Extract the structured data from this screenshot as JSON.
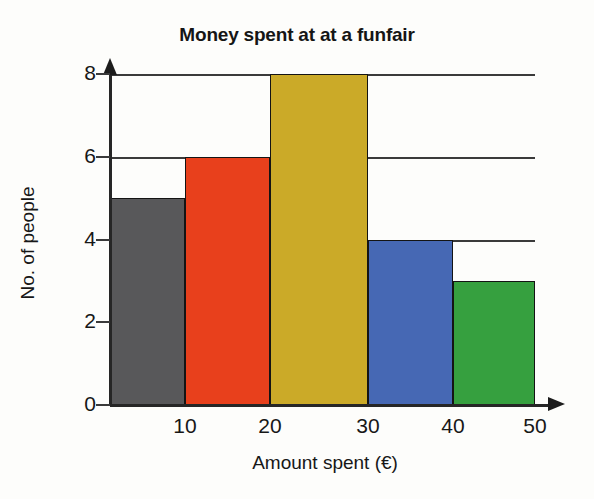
{
  "chart_data": {
    "type": "bar",
    "title": "Money spent at at a funfair",
    "xlabel": "Amount spent (€)",
    "ylabel": "No. of people",
    "categories": [
      "0-10",
      "10-20",
      "20-30",
      "30-40",
      "40-50"
    ],
    "values": [
      5,
      6,
      8,
      4,
      3
    ],
    "bin_edges": [
      0,
      10,
      20,
      30,
      40,
      50
    ],
    "bar_colors": [
      "#58585a",
      "#e8401c",
      "#cbaa28",
      "#4668b4",
      "#36a03f"
    ],
    "xtick_labels": [
      "10",
      "20",
      "30",
      "40",
      "50"
    ],
    "xticks": [
      10,
      20,
      30,
      40,
      50
    ],
    "ytick_labels": [
      "0",
      "2",
      "4",
      "6",
      "8"
    ],
    "yticks": [
      0,
      2,
      4,
      6,
      8
    ],
    "ylim": [
      0,
      8
    ],
    "xlim": [
      0,
      50
    ],
    "grid": true,
    "gridlines_at": [
      4,
      6,
      8
    ],
    "legend": null,
    "axis_color": "#262626",
    "grid_color": "#3a3a3a",
    "bar_outline_color": "#141414",
    "background_color": "#fdfdfb"
  },
  "bars": [
    {
      "label": "0-10",
      "value": 5,
      "color": "#58585a",
      "left": 110,
      "width": 75
    },
    {
      "label": "10-20",
      "value": 6,
      "color": "#e8401c",
      "left": 185,
      "width": 85
    },
    {
      "label": "20-30",
      "value": 8,
      "color": "#cbaa28",
      "left": 270,
      "width": 98
    },
    {
      "label": "30-40",
      "value": 4,
      "color": "#4668b4",
      "left": 368,
      "width": 85
    },
    {
      "label": "40-50",
      "value": 3,
      "color": "#36a03f",
      "left": 453,
      "width": 82
    }
  ]
}
